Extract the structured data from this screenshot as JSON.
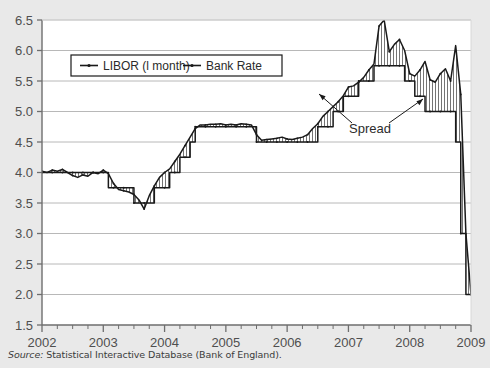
{
  "figure": {
    "background_color": "#e9e9e9",
    "plot_background_color": "#ffffff",
    "line_color": "#1a1a1a",
    "grid_color": "#b0b0b0",
    "axis_color": "#6e6e6e"
  },
  "source": {
    "label": "Source:",
    "text": " Statistical Interactive Database (Bank of England)."
  },
  "annotations": {
    "spread": "Spread"
  },
  "chart_data": {
    "type": "line",
    "title": "",
    "subtitle": "",
    "xlabel": "",
    "ylabel": "",
    "grid": true,
    "legend_position": "top-left-inside",
    "xlim": [
      2002.0,
      2009.0
    ],
    "ylim": [
      1.5,
      6.5
    ],
    "yticks": [
      1.5,
      2.0,
      2.5,
      3.0,
      3.5,
      4.0,
      4.5,
      5.0,
      5.5,
      6.0,
      6.5
    ],
    "ytick_labels": [
      "1.5",
      "2.0",
      "2.5",
      "3.0",
      "3.5",
      "4.0",
      "4.5",
      "5.0",
      "5.5",
      "6.0",
      "6.5"
    ],
    "xticks": [
      2002,
      2003,
      2004,
      2005,
      2006,
      2007,
      2008,
      2009
    ],
    "xtick_labels": [
      "2002",
      "2003",
      "2004",
      "2005",
      "2006",
      "2007",
      "2008",
      "2009"
    ],
    "minor_xticks_per_interval": 4,
    "series": [
      {
        "name": "LIBOR (l month)",
        "marker": "line-with-dot",
        "x": [
          2002.0,
          2002.083,
          2002.167,
          2002.25,
          2002.333,
          2002.417,
          2002.5,
          2002.583,
          2002.667,
          2002.75,
          2002.833,
          2002.917,
          2003.0,
          2003.083,
          2003.167,
          2003.25,
          2003.333,
          2003.417,
          2003.5,
          2003.583,
          2003.667,
          2003.75,
          2003.833,
          2003.917,
          2004.0,
          2004.083,
          2004.167,
          2004.25,
          2004.333,
          2004.417,
          2004.5,
          2004.583,
          2004.667,
          2004.75,
          2004.833,
          2004.917,
          2005.0,
          2005.083,
          2005.167,
          2005.25,
          2005.333,
          2005.417,
          2005.5,
          2005.583,
          2005.667,
          2005.75,
          2005.833,
          2005.917,
          2006.0,
          2006.083,
          2006.167,
          2006.25,
          2006.333,
          2006.417,
          2006.5,
          2006.583,
          2006.667,
          2006.75,
          2006.833,
          2006.917,
          2007.0,
          2007.083,
          2007.167,
          2007.25,
          2007.333,
          2007.417,
          2007.5,
          2007.583,
          2007.667,
          2007.75,
          2007.833,
          2007.917,
          2008.0,
          2008.083,
          2008.167,
          2008.25,
          2008.333,
          2008.417,
          2008.5,
          2008.583,
          2008.667,
          2008.75,
          2008.833,
          2008.917,
          2009.0
        ],
        "y": [
          4.02,
          4.0,
          4.04,
          4.02,
          4.05,
          4.0,
          3.95,
          3.92,
          3.96,
          3.94,
          4.0,
          3.98,
          4.04,
          3.98,
          3.82,
          3.72,
          3.7,
          3.68,
          3.64,
          3.55,
          3.4,
          3.62,
          3.78,
          3.92,
          4.0,
          4.06,
          4.18,
          4.3,
          4.44,
          4.58,
          4.72,
          4.78,
          4.78,
          4.79,
          4.79,
          4.8,
          4.78,
          4.79,
          4.78,
          4.8,
          4.79,
          4.78,
          4.62,
          4.53,
          4.54,
          4.55,
          4.56,
          4.58,
          4.55,
          4.54,
          4.56,
          4.58,
          4.62,
          4.72,
          4.8,
          4.92,
          5.0,
          5.08,
          5.16,
          5.26,
          5.4,
          5.42,
          5.48,
          5.56,
          5.68,
          5.78,
          6.4,
          6.5,
          5.98,
          6.1,
          6.18,
          6.0,
          5.62,
          5.58,
          5.68,
          5.82,
          5.52,
          5.48,
          5.62,
          5.7,
          5.5,
          6.08,
          5.28,
          3.0,
          2.0
        ],
        "notes": "One-month LIBOR; spikes above Bank Rate from Aug 2007, peak ~6.5 in Sep 2007 and ~6.1 in Oct 2008, then collapses to ~2.0 at end of period."
      },
      {
        "name": "Bank Rate",
        "marker": "line-with-dot",
        "x": [
          2002.0,
          2002.083,
          2002.167,
          2002.25,
          2002.333,
          2002.417,
          2002.5,
          2002.583,
          2002.667,
          2002.75,
          2002.833,
          2002.917,
          2003.0,
          2003.083,
          2003.167,
          2003.25,
          2003.333,
          2003.417,
          2003.5,
          2003.583,
          2003.667,
          2003.75,
          2003.833,
          2003.917,
          2004.0,
          2004.083,
          2004.167,
          2004.25,
          2004.333,
          2004.417,
          2004.5,
          2004.583,
          2004.667,
          2004.75,
          2004.833,
          2004.917,
          2005.0,
          2005.083,
          2005.167,
          2005.25,
          2005.333,
          2005.417,
          2005.5,
          2005.583,
          2005.667,
          2005.75,
          2005.833,
          2005.917,
          2006.0,
          2006.083,
          2006.167,
          2006.25,
          2006.333,
          2006.417,
          2006.5,
          2006.583,
          2006.667,
          2006.75,
          2006.833,
          2006.917,
          2007.0,
          2007.083,
          2007.167,
          2007.25,
          2007.333,
          2007.417,
          2007.5,
          2007.583,
          2007.667,
          2007.75,
          2007.833,
          2007.917,
          2008.0,
          2008.083,
          2008.167,
          2008.25,
          2008.333,
          2008.417,
          2008.5,
          2008.583,
          2008.667,
          2008.75,
          2008.833,
          2008.917,
          2009.0
        ],
        "y": [
          4.0,
          4.0,
          4.0,
          4.0,
          4.0,
          4.0,
          4.0,
          4.0,
          4.0,
          4.0,
          4.0,
          4.0,
          4.0,
          3.75,
          3.75,
          3.75,
          3.75,
          3.75,
          3.5,
          3.5,
          3.5,
          3.5,
          3.75,
          3.75,
          3.75,
          4.0,
          4.0,
          4.25,
          4.25,
          4.5,
          4.75,
          4.75,
          4.75,
          4.75,
          4.75,
          4.75,
          4.75,
          4.75,
          4.75,
          4.75,
          4.75,
          4.75,
          4.5,
          4.5,
          4.5,
          4.5,
          4.5,
          4.5,
          4.5,
          4.5,
          4.5,
          4.5,
          4.5,
          4.5,
          4.75,
          4.75,
          4.75,
          5.0,
          5.0,
          5.25,
          5.25,
          5.25,
          5.5,
          5.5,
          5.5,
          5.75,
          5.75,
          5.75,
          5.75,
          5.75,
          5.75,
          5.5,
          5.5,
          5.25,
          5.25,
          5.0,
          5.0,
          5.0,
          5.0,
          5.0,
          5.0,
          4.5,
          3.0,
          2.0,
          2.0
        ],
        "notes": "Bank of England official Bank Rate, step function."
      }
    ],
    "fill_between": {
      "label": "Spread",
      "pattern": "vertical-hatch",
      "between": [
        "LIBOR (l month)",
        "Bank Rate"
      ]
    }
  },
  "legend": {
    "items": [
      {
        "label": "LIBOR (l month)"
      },
      {
        "label": "Bank Rate"
      }
    ]
  }
}
